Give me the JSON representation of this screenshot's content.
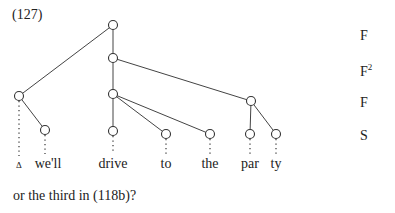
{
  "example_number": "(127)",
  "levels": [
    {
      "label": "F",
      "sup": ""
    },
    {
      "label": "F",
      "sup": "2"
    },
    {
      "label": "F",
      "sup": ""
    },
    {
      "label": "S",
      "sup": ""
    }
  ],
  "words": [
    {
      "text": "Δ"
    },
    {
      "text": "we'll"
    },
    {
      "text": "drive"
    },
    {
      "text": "to"
    },
    {
      "text": "the"
    },
    {
      "text": "par"
    },
    {
      "text": "ty"
    }
  ],
  "caption": "or the third in (118b)?"
}
